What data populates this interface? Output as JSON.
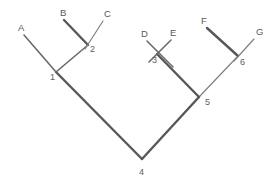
{
  "figure": {
    "background_color": "#ffffff",
    "line_color": "#5a5a5c",
    "label_color": "#57575a",
    "width": 278,
    "height": 183
  },
  "taxa": [
    {
      "id": "A",
      "label": "A",
      "label_x": 18,
      "label_y": 31,
      "tip_x": 24,
      "tip_y": 35,
      "node": "1",
      "weight": "med"
    },
    {
      "id": "B",
      "label": "B",
      "label_x": 60,
      "label_y": 16,
      "tip_x": 64,
      "tip_y": 20,
      "node": "2",
      "weight": "thick"
    },
    {
      "id": "C",
      "label": "C",
      "label_x": 104,
      "label_y": 17,
      "tip_x": 103,
      "tip_y": 21,
      "node": "2",
      "weight": "thin"
    },
    {
      "id": "D",
      "label": "D",
      "label_x": 141,
      "label_y": 37,
      "tip_x": 147,
      "tip_y": 41,
      "node": "3",
      "weight": "med"
    },
    {
      "id": "E",
      "label": "E",
      "label_x": 170,
      "label_y": 36,
      "tip_x": 171,
      "tip_y": 40,
      "node": "3",
      "weight": "med"
    },
    {
      "id": "F",
      "label": "F",
      "label_x": 201,
      "label_y": 24,
      "tip_x": 207,
      "tip_y": 28,
      "node": "6",
      "weight": "thick"
    },
    {
      "id": "G",
      "label": "G",
      "label_x": 256,
      "label_y": 35,
      "tip_x": 254,
      "tip_y": 39,
      "node": "6",
      "weight": "thin"
    }
  ],
  "nodes": [
    {
      "id": "1",
      "label": "1",
      "x": 56,
      "y": 72,
      "label_x": 50,
      "label_y": 80
    },
    {
      "id": "2",
      "label": "2",
      "x": 88,
      "y": 45,
      "label_x": 90,
      "label_y": 52
    },
    {
      "id": "3",
      "label": "3",
      "x": 157,
      "y": 54,
      "label_x": 152,
      "label_y": 63
    },
    {
      "id": "4",
      "label": "4",
      "x": 142,
      "y": 159,
      "label_x": 139,
      "label_y": 175
    },
    {
      "id": "5",
      "label": "5",
      "x": 199,
      "y": 97,
      "label_x": 205,
      "label_y": 105
    },
    {
      "id": "6",
      "label": "6",
      "x": 238,
      "y": 56,
      "label_x": 240,
      "label_y": 65
    }
  ],
  "internal_branches": [
    {
      "from": "1",
      "to": "2",
      "weight": "med",
      "path": "M 56 72 L 88 45"
    },
    {
      "from": "1",
      "to": "4",
      "weight": "thick",
      "path": "M 56 72 L 142 159"
    },
    {
      "from": "3",
      "to": "5",
      "weight": "thick",
      "path": "M 157 54 L 199 97"
    },
    {
      "from": "5",
      "to": "6",
      "weight": "thin",
      "path": "M 199 97 L 238 56"
    },
    {
      "from": "4",
      "to": "5",
      "weight": "thick",
      "path": "M 142 159 L 199 97"
    }
  ],
  "tip_branches": [
    {
      "taxon": "A",
      "weight": "med",
      "path": "M 24 35 L 56 72"
    },
    {
      "taxon": "B",
      "weight": "thick",
      "path": "M 64 20 L 88 45"
    },
    {
      "taxon": "C",
      "weight": "thin",
      "path": "M 103 21 L 88 45"
    },
    {
      "taxon": "D",
      "weight": "med",
      "path": "M 147 41 L 172 66"
    },
    {
      "taxon": "E",
      "weight": "med",
      "path": "M 171 40 L 150 62"
    },
    {
      "taxon": "F",
      "weight": "thick",
      "path": "M 207 28 L 238 56"
    },
    {
      "taxon": "G",
      "weight": "thin",
      "path": "M 254 39 L 238 56"
    }
  ]
}
